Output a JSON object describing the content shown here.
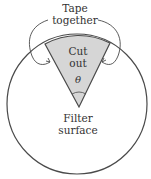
{
  "diagram": {
    "labels": {
      "tape_line1": "Tape",
      "tape_line2": "together",
      "cut_line1": "Cut",
      "cut_line2": "out",
      "angle": "θ",
      "filter_line1": "Filter",
      "filter_line2": "surface"
    },
    "colors": {
      "stroke": "#4a4a4a",
      "wedge_fill": "#d6d6d6",
      "background": "#ffffff"
    }
  }
}
